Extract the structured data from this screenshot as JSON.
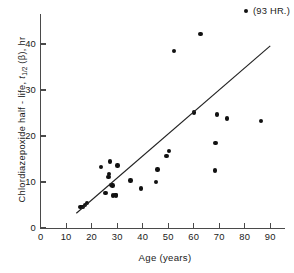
{
  "chart_data": {
    "type": "scatter",
    "title": "",
    "xlabel": "Age  (years)",
    "ylabel_full": "Chlordiazepoxide  half - life, t1/2 (β), hr",
    "ylabel_prefix": "Chlordiazepoxide  half - life, ",
    "ylabel_var": "t",
    "ylabel_sub": "1/2",
    "ylabel_suffix": " (β), hr",
    "xlim": [
      0,
      95
    ],
    "ylim": [
      0,
      45
    ],
    "xticks": [
      0,
      10,
      20,
      30,
      40,
      50,
      60,
      70,
      80,
      90
    ],
    "yticks": [
      0,
      10,
      20,
      30,
      40
    ],
    "grid": false,
    "legend": "none",
    "marker_color": "#111111",
    "axis_color": "#4a4a4a",
    "annotation": "(93 HR.)",
    "points": [
      {
        "x": 15.6,
        "y": 4.6
      },
      {
        "x": 16.4,
        "y": 4.6
      },
      {
        "x": 17.3,
        "y": 5.0
      },
      {
        "x": 18.3,
        "y": 5.4
      },
      {
        "x": 23.6,
        "y": 13.3
      },
      {
        "x": 25.4,
        "y": 7.6
      },
      {
        "x": 26.6,
        "y": 11.1
      },
      {
        "x": 26.9,
        "y": 11.8
      },
      {
        "x": 27.2,
        "y": 14.5
      },
      {
        "x": 27.8,
        "y": 9.4
      },
      {
        "x": 28.2,
        "y": 9.2
      },
      {
        "x": 28.4,
        "y": 7.1
      },
      {
        "x": 29.3,
        "y": 7.2
      },
      {
        "x": 29.6,
        "y": 7.1
      },
      {
        "x": 30.2,
        "y": 13.6
      },
      {
        "x": 35.2,
        "y": 10.3
      },
      {
        "x": 39.3,
        "y": 8.6
      },
      {
        "x": 45.2,
        "y": 10.0
      },
      {
        "x": 45.8,
        "y": 12.7
      },
      {
        "x": 49.3,
        "y": 15.6
      },
      {
        "x": 50.4,
        "y": 16.8
      },
      {
        "x": 52.3,
        "y": 38.5
      },
      {
        "x": 60.1,
        "y": 25.1
      },
      {
        "x": 62.7,
        "y": 42.2
      },
      {
        "x": 68.3,
        "y": 12.5
      },
      {
        "x": 68.6,
        "y": 18.5
      },
      {
        "x": 69.2,
        "y": 24.7
      },
      {
        "x": 73.1,
        "y": 23.8
      },
      {
        "x": 86.4,
        "y": 23.3
      }
    ],
    "fit_line": {
      "x1": 14.0,
      "y1": 3.2,
      "x2": 90.0,
      "y2": 39.6
    },
    "offscale_point": {
      "label": "(93 HR.)"
    }
  },
  "caption": {
    "partial_text": ""
  }
}
